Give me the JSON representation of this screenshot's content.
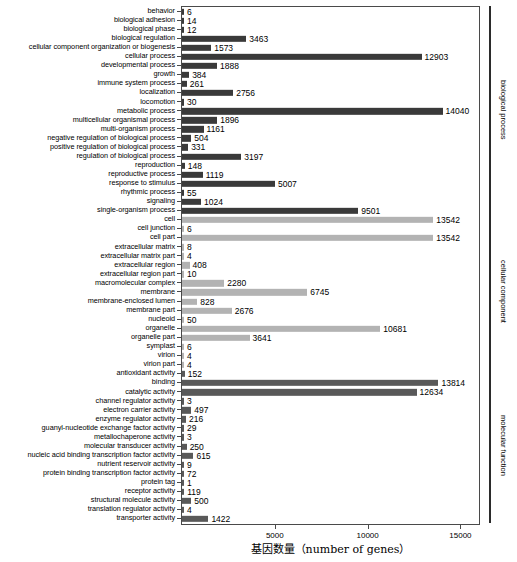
{
  "chart_data": {
    "type": "bar",
    "orientation": "horizontal",
    "title": "",
    "xlabel": "基因数量（number of genes）",
    "ylabel": "",
    "xlim": [
      0,
      16000
    ],
    "xticks": [
      5000,
      10000,
      15000
    ],
    "xticklabels": [
      "5000",
      "10000",
      "15000"
    ],
    "grid": false,
    "legend_position": "right-brackets",
    "categories": [
      "behavior",
      "biological adhesion",
      "biological phase",
      "biological regulation",
      "cellular component organization or biogenesis",
      "cellular process",
      "developmental process",
      "growth",
      "immune system process",
      "localization",
      "locomotion",
      "metabolic process",
      "multicellular organismal process",
      "multi-organism process",
      "negative regulation of biological process",
      "positive regulation of biological process",
      "regulation of biological process",
      "reproduction",
      "reproductive process",
      "response to stimulus",
      "rhythmic process",
      "signaling",
      "single-organism process",
      "cell",
      "cell junction",
      "cell part",
      "extracellular matrix",
      "extracellular matrix part",
      "extracellular region",
      "extracellular region part",
      "macromolecular complex",
      "membrane",
      "membrane-enclosed lumen",
      "membrane part",
      "nucleoid",
      "organelle",
      "organelle part",
      "symplast",
      "virion",
      "virion part",
      "antioxidant activity",
      "binding",
      "catalytic activity",
      "channel regulator activity",
      "electron carrier activity",
      "enzyme regulator activity",
      "guanyl-nucleotide exchange factor activity",
      "metallochaperone activity",
      "molecular transducer activity",
      "nucleic acid binding transcription factor activity",
      "nutrient reservoir activity",
      "protein binding transcription factor activity",
      "protein tag",
      "receptor activity",
      "structural molecule activity",
      "translation regulator activity",
      "transporter activity"
    ],
    "values": [
      6,
      14,
      12,
      3463,
      1573,
      12903,
      1888,
      384,
      261,
      2756,
      30,
      14040,
      1896,
      1161,
      504,
      331,
      3197,
      148,
      1119,
      5007,
      55,
      1024,
      9501,
      13542,
      6,
      13542,
      8,
      4,
      408,
      10,
      2280,
      6745,
      828,
      2676,
      50,
      10681,
      3641,
      6,
      4,
      4,
      152,
      13814,
      12634,
      3,
      497,
      216,
      29,
      3,
      250,
      615,
      9,
      72,
      1,
      119,
      500,
      4,
      1422
    ],
    "groups": [
      {
        "name": "biological process",
        "start": 0,
        "end": 22,
        "color": "#3a3a3a"
      },
      {
        "name": "cellular component",
        "start": 23,
        "end": 39,
        "color": "#b3b3b3"
      },
      {
        "name": "molecular function",
        "start": 40,
        "end": 56,
        "color": "#595959"
      }
    ]
  }
}
